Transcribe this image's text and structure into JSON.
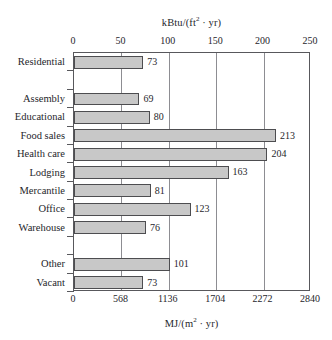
{
  "chart_data": {
    "type": "bar",
    "orientation": "horizontal",
    "title": "",
    "categories": [
      "Residential",
      "Assembly",
      "Educational",
      "Food sales",
      "Health care",
      "Lodging",
      "Mercantile",
      "Office",
      "Warehouse",
      "Other",
      "Vacant"
    ],
    "values": [
      73,
      69,
      80,
      213,
      204,
      163,
      81,
      123,
      76,
      101,
      73
    ],
    "xlabel": "kBtu/(ft² · yr)",
    "xlabel_secondary": "MJ/(m² · yr)",
    "ylabel": "",
    "xlim": [
      0,
      250
    ],
    "xlim_secondary": [
      0,
      2840
    ],
    "xticks": [
      0,
      50,
      100,
      150,
      200,
      250
    ],
    "xticks_secondary": [
      0,
      568,
      1136,
      1704,
      2272,
      2840
    ],
    "grid": true,
    "legend": false,
    "bar_color": "#c8c8c8",
    "bar_border_color": "#4d4d50",
    "axis_color": "#58585c",
    "gridline_color": "#8d8d92",
    "data_labels_shown": true
  },
  "axes": {
    "top_title_prefix": "kBtu/(ft",
    "top_title_exponent": "2",
    "top_title_suffix": " · yr)",
    "bottom_title_prefix": "MJ/(m",
    "bottom_title_exponent": "2",
    "bottom_title_suffix": " · yr)",
    "top_ticks": [
      "0",
      "50",
      "100",
      "150",
      "200",
      "250"
    ],
    "bottom_ticks": [
      "0",
      "568",
      "1136",
      "1704",
      "2272",
      "2840"
    ]
  },
  "rows": [
    {
      "label": "Residential",
      "value": 73,
      "value_text": "73",
      "gap_after": true
    },
    {
      "label": "Assembly",
      "value": 69,
      "value_text": "69",
      "gap_after": false
    },
    {
      "label": "Educational",
      "value": 80,
      "value_text": "80",
      "gap_after": false
    },
    {
      "label": "Food sales",
      "value": 213,
      "value_text": "213",
      "gap_after": false
    },
    {
      "label": "Health care",
      "value": 204,
      "value_text": "204",
      "gap_after": false
    },
    {
      "label": "Lodging",
      "value": 163,
      "value_text": "163",
      "gap_after": false
    },
    {
      "label": "Mercantile",
      "value": 81,
      "value_text": "81",
      "gap_after": false
    },
    {
      "label": "Office",
      "value": 123,
      "value_text": "123",
      "gap_after": false
    },
    {
      "label": "Warehouse",
      "value": 76,
      "value_text": "76",
      "gap_after": true
    },
    {
      "label": "Other",
      "value": 101,
      "value_text": "101",
      "gap_after": false
    },
    {
      "label": "Vacant",
      "value": 73,
      "value_text": "73",
      "gap_after": false
    }
  ]
}
